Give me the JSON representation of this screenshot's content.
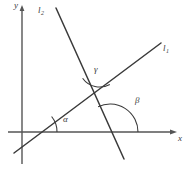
{
  "figure": {
    "background_color": "#ffffff",
    "stroke_color": "#3a3a3a",
    "axis_color": "#555555"
  },
  "axes": {
    "x_label": "x",
    "y_label": "y",
    "origin": {
      "x": 22,
      "y": 132
    },
    "x_axis": {
      "x1": 8,
      "y1": 132,
      "x2": 176,
      "y2": 132
    },
    "y_axis": {
      "x1": 22,
      "y1": 164,
      "x2": 22,
      "y2": 7
    }
  },
  "lines": [
    {
      "id": "l1",
      "label": "l",
      "subscript": "1",
      "x1": 14,
      "y1": 153,
      "x2": 161,
      "y2": 43,
      "description": "rising line through origin region"
    },
    {
      "id": "l2",
      "label": "l",
      "subscript": "2",
      "x1": 56,
      "y1": 8,
      "x2": 124,
      "y2": 159,
      "description": "steep falling line"
    }
  ],
  "intersections": {
    "lines_cross": {
      "x": 92,
      "y": 97
    },
    "l1_x_axis": {
      "x": 33,
      "y": 132
    },
    "l2_x_axis": {
      "x": 110,
      "y": 132
    }
  },
  "angles": [
    {
      "id": "alpha",
      "symbol": "α",
      "vertex": {
        "x": 33,
        "y": 132
      },
      "radius": 24,
      "between": [
        "x-axis",
        "l1"
      ],
      "label_position": {
        "x": 63,
        "y": 115
      }
    },
    {
      "id": "beta",
      "symbol": "β",
      "vertex": {
        "x": 110,
        "y": 132
      },
      "radius": 28,
      "between": [
        "x-axis",
        "l2"
      ],
      "label_position": {
        "x": 135,
        "y": 96
      }
    },
    {
      "id": "gamma",
      "symbol": "γ",
      "vertex": {
        "x": 92,
        "y": 97
      },
      "radius": 21,
      "between": [
        "l2",
        "l1"
      ],
      "label_position": {
        "x": 94,
        "y": 65
      }
    }
  ]
}
